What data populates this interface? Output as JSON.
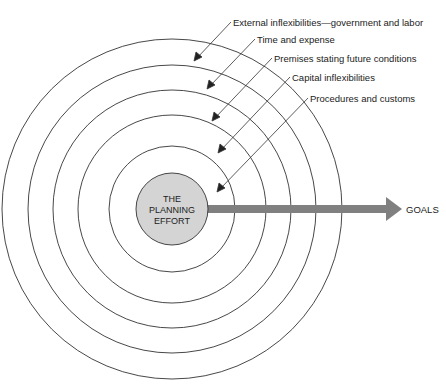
{
  "diagram": {
    "center": {
      "lines": [
        "THE",
        "PLANNING",
        "EFFORT"
      ],
      "fill": "#d4d4d4"
    },
    "goal": {
      "label": "GOALS",
      "arrow_color": "#808080"
    },
    "constraints": [
      {
        "label": "External inflexibilities—government and labor"
      },
      {
        "label": "Time and expense"
      },
      {
        "label": "Premises stating future conditions"
      },
      {
        "label": "Capital inflexibilities"
      },
      {
        "label": "Procedures and customs"
      }
    ]
  }
}
